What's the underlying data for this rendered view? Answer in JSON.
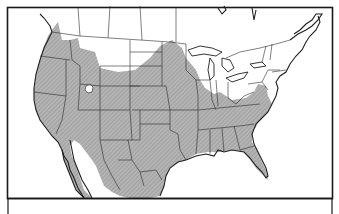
{
  "map": {
    "subject": "Range map of North America (United States, southern Canada, northern Mexico)",
    "style": "black-and-white line map with hatched gray shading",
    "colors": {
      "background": "#ffffff",
      "land": "#ffffff",
      "range_fill": "#a8a8a8",
      "boundary_stroke": "#222222",
      "frame_stroke": "#1a1a1a"
    },
    "shaded_range": {
      "description": "Shaded distribution covering most of the contiguous United States west of the Appalachians and south of the northern plains, plus northern Mexico; unshaded in the upper Midwest / Great Lakes, Northeast, southern Canada, and parts of the Atlantic coast",
      "unshaded_islands": [
        "small area in Utah/Idaho (Great Salt Lake region)",
        "northern Montana / southern Alberta band",
        "Atlantic coastal strip of Georgia/Carolinas"
      ]
    },
    "legend": null
  }
}
